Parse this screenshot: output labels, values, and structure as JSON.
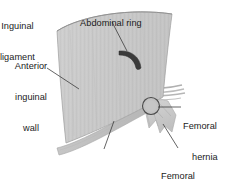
{
  "figure": {
    "background_color": "#ffffff",
    "text_color": "#1a1a1a",
    "width": 236,
    "height": 185
  },
  "labels": {
    "abdominal_ring": "Abdominal ring",
    "anterior_inguinal_wall_line1": "Anterior",
    "anterior_inguinal_wall_line2": "inguinal",
    "anterior_inguinal_wall_line3": "wall",
    "femoral_hernia_line1": "Femoral",
    "femoral_hernia_line2": "hernia",
    "inguinal_ligament_line1": "Inguinal",
    "inguinal_ligament_line2": "ligament",
    "femoral_sheath_line1": "Femoral",
    "femoral_sheath_line2": "sheath"
  },
  "anatomy": {
    "aponeurosis_fill": "#c9c9c9",
    "aponeurosis_edge": "#9a9a9a",
    "fiber_stroke": "#b4b4b4",
    "abdominal_ring_fill": "#3b3b3b",
    "ligament_fill": "#c2c2c2",
    "sheath_fill": "#cfcfcf",
    "hernia_ring_stroke": "#4a4a4a",
    "leader_stroke": "#3c3c3c",
    "parts": [
      "anterior-inguinal-wall-aponeurosis",
      "abdominal-ring",
      "inguinal-ligament",
      "femoral-sheath",
      "femoral-hernia-ring"
    ]
  },
  "leaders": [
    {
      "name": "abdominal-ring-leader",
      "x1": 112,
      "y1": 22,
      "x2": 127,
      "y2": 51
    },
    {
      "name": "anterior-wall-leader",
      "x1": 47,
      "y1": 68,
      "x2": 79,
      "y2": 89
    },
    {
      "name": "femoral-hernia-leader",
      "x1": 181,
      "y1": 107,
      "x2": 158,
      "y2": 107
    },
    {
      "name": "inguinal-ligament-leader",
      "x1": 104,
      "y1": 149,
      "x2": 114,
      "y2": 121
    },
    {
      "name": "femoral-sheath-leader",
      "x1": 178,
      "y1": 148,
      "x2": 163,
      "y2": 124
    }
  ]
}
